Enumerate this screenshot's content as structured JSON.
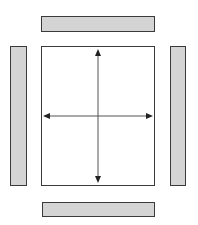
{
  "diagram": {
    "colors": {
      "bar_fill": "#d4d4d4",
      "border": "#3a3a3a",
      "arrow": "#222222",
      "background": "#ffffff"
    },
    "elements": {
      "top_bar": {
        "x": 41,
        "y": 16,
        "w": 114,
        "h": 16
      },
      "bottom_bar": {
        "x": 42,
        "y": 202,
        "w": 113,
        "h": 15
      },
      "left_bar": {
        "x": 10,
        "y": 46,
        "w": 17,
        "h": 140
      },
      "right_bar": {
        "x": 170,
        "y": 46,
        "w": 16,
        "h": 140
      },
      "center_box": {
        "x": 41,
        "y": 46,
        "w": 114,
        "h": 140
      }
    },
    "arrows": [
      {
        "name": "vertical",
        "x1": 98,
        "y1": 50,
        "x2": 98,
        "y2": 182,
        "heads": "both"
      },
      {
        "name": "horizontal",
        "x1": 44,
        "y1": 116,
        "x2": 152,
        "y2": 116,
        "heads": "both"
      }
    ]
  }
}
